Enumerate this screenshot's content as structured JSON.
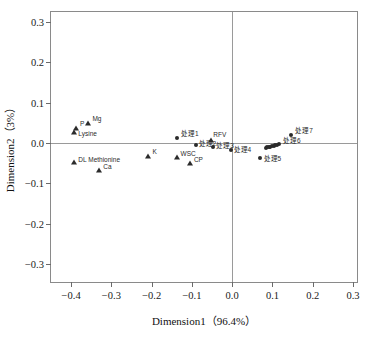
{
  "chart_data": {
    "type": "scatter",
    "title": "",
    "xlabel": "Dimension1（96.4%）",
    "ylabel": "Dimension2（3%）",
    "xlim": [
      -0.45,
      0.31
    ],
    "ylim": [
      -0.345,
      0.325
    ],
    "xticks": [
      -0.4,
      -0.3,
      -0.2,
      -0.1,
      0.0,
      0.1,
      0.2,
      0.3
    ],
    "xticklabels": [
      "−0.4",
      "−0.3",
      "−0.2",
      "−0.1",
      "0.0",
      "0.1",
      "0.2",
      "0.3"
    ],
    "yticks": [
      -0.3,
      -0.2,
      -0.1,
      0.0,
      0.1,
      0.2,
      0.3
    ],
    "yticklabels": [
      "−0.3",
      "−0.2",
      "−0.1",
      "0.0",
      "0.1",
      "0.2",
      "0.3"
    ],
    "grid": false,
    "legend": "none",
    "zero_lines": true,
    "series": [
      {
        "name": "variables",
        "marker": "triangle",
        "points": [
          {
            "label": "P",
            "x": -0.388,
            "y": 0.036,
            "lx": 4,
            "ly": -7
          },
          {
            "label": "Lysine",
            "x": -0.392,
            "y": 0.026,
            "lx": 4,
            "ly": -1
          },
          {
            "label": "Mg",
            "x": -0.357,
            "y": 0.05,
            "lx": 4,
            "ly": -7
          },
          {
            "label": "DL Methionine",
            "x": -0.392,
            "y": -0.046,
            "lx": 4,
            "ly": -5
          },
          {
            "label": "Ca",
            "x": -0.33,
            "y": -0.066,
            "lx": 4,
            "ly": -6
          },
          {
            "label": "K",
            "x": -0.208,
            "y": -0.032,
            "lx": 4,
            "ly": -7
          },
          {
            "label": "WSC",
            "x": -0.138,
            "y": -0.034,
            "lx": 4,
            "ly": -6
          },
          {
            "label": "CP",
            "x": -0.105,
            "y": -0.05,
            "lx": 4,
            "ly": -6
          },
          {
            "label": "RFV",
            "x": -0.052,
            "y": 0.008,
            "lx": 2,
            "ly": -8
          }
        ]
      },
      {
        "name": "treatments",
        "marker": "circle",
        "points": [
          {
            "label": "处理1",
            "x": -0.137,
            "y": 0.013,
            "lx": 4,
            "ly": -7
          },
          {
            "label": "处理2",
            "x": -0.091,
            "y": -0.006,
            "lx": 3,
            "ly": -4
          },
          {
            "label": "处理3",
            "x": -0.047,
            "y": -0.01,
            "lx": 3,
            "ly": -4
          },
          {
            "label": "处理4",
            "x": -0.004,
            "y": -0.017,
            "lx": 3,
            "ly": -3
          },
          {
            "label": "处理5",
            "x": 0.068,
            "y": -0.037,
            "lx": 4,
            "ly": -2
          },
          {
            "label": "处理6",
            "x": 0.116,
            "y": -0.003,
            "lx": 4,
            "ly": -6
          },
          {
            "label": "处理7",
            "x": 0.147,
            "y": 0.019,
            "lx": 4,
            "ly": -7
          },
          {
            "label": "",
            "x": 0.083,
            "y": -0.012,
            "lx": 0,
            "ly": 0
          },
          {
            "label": "",
            "x": 0.087,
            "y": -0.011,
            "lx": 0,
            "ly": 0
          },
          {
            "label": "",
            "x": 0.091,
            "y": -0.01,
            "lx": 0,
            "ly": 0
          },
          {
            "label": "",
            "x": 0.095,
            "y": -0.009,
            "lx": 0,
            "ly": 0
          },
          {
            "label": "",
            "x": 0.099,
            "y": -0.008,
            "lx": 0,
            "ly": 0
          },
          {
            "label": "",
            "x": 0.103,
            "y": -0.007,
            "lx": 0,
            "ly": 0
          },
          {
            "label": "",
            "x": 0.107,
            "y": -0.006,
            "lx": 0,
            "ly": 0
          },
          {
            "label": "",
            "x": 0.111,
            "y": -0.005,
            "lx": 0,
            "ly": 0
          }
        ]
      }
    ]
  },
  "colors": {
    "marker": "#2b2b2b",
    "frame": "#8a8a8a",
    "zero_line": "#9a9a9a",
    "text": "#111111",
    "background": "#ffffff"
  }
}
